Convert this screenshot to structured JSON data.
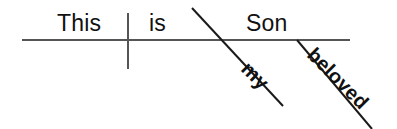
{
  "diagram": {
    "type": "reed-kellogg-sentence-diagram",
    "sentence": "This is my beloved Son",
    "canvas": {
      "width": 397,
      "height": 129,
      "background": "#ffffff"
    },
    "colors": {
      "baseline": "#555555",
      "divider": "#555555",
      "modifier_line": "#1a1a1a",
      "text": "#111111"
    },
    "lines": {
      "baseline": {
        "name": "main-baseline",
        "x1": 22,
        "y1": 40,
        "x2": 350,
        "y2": 40,
        "width": 2,
        "color": "#555555"
      },
      "subject_verb_divider": {
        "name": "subject-verb-divider",
        "x1": 128,
        "y1": 13,
        "x2": 128,
        "y2": 69,
        "width": 2,
        "color": "#555555"
      },
      "modifier_my": {
        "name": "modifier-line-my",
        "x1": 192,
        "y1": 8,
        "x2": 283,
        "y2": 106,
        "width": 2,
        "color": "#1a1a1a"
      },
      "modifier_beloved": {
        "name": "modifier-line-beloved",
        "x1": 297,
        "y1": 40,
        "x2": 372,
        "y2": 129,
        "width": 2,
        "color": "#1a1a1a"
      }
    },
    "words": {
      "subject": {
        "text": "This",
        "role": "subject"
      },
      "verb": {
        "text": "is",
        "role": "linking-verb"
      },
      "complement": {
        "text": "Son",
        "role": "predicate-nominative"
      },
      "modifier_1": {
        "text": "my",
        "role": "modifier"
      },
      "modifier_2": {
        "text": "beloved",
        "role": "modifier"
      }
    }
  }
}
